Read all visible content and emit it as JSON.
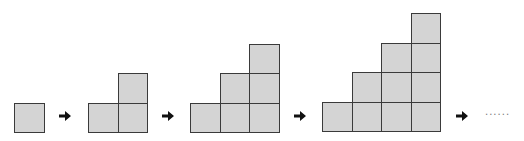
{
  "diagram": {
    "cell_color": "#d4d4d4",
    "border_color": "#3a3a3a",
    "figures": [
      {
        "step": 1,
        "columns": [
          1
        ],
        "origin_x": 14,
        "base_y": 132
      },
      {
        "step": 2,
        "columns": [
          1,
          2
        ],
        "origin_x": 88,
        "base_y": 132
      },
      {
        "step": 3,
        "columns": [
          1,
          2,
          3
        ],
        "origin_x": 190,
        "base_y": 132
      },
      {
        "step": 4,
        "columns": [
          1,
          2,
          3,
          4
        ],
        "origin_x": 322,
        "base_y": 131
      }
    ],
    "arrows": [
      {
        "name": "arrow-1",
        "x": 58,
        "y": 109
      },
      {
        "name": "arrow-2",
        "x": 161,
        "y": 109
      },
      {
        "name": "arrow-3",
        "x": 293,
        "y": 109
      },
      {
        "name": "arrow-4",
        "x": 455,
        "y": 109
      }
    ],
    "continuation": "......"
  }
}
